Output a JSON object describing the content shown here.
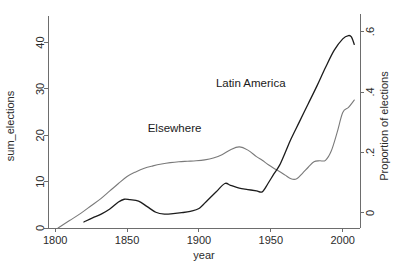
{
  "chart_data": {
    "type": "line",
    "title": "",
    "xlabel": "year",
    "ylabel": "sum_elections",
    "ylabel_right": "Proportion of elections",
    "xlim": [
      1795,
      2012
    ],
    "ylim": [
      0,
      44
    ],
    "ylim_right": [
      -0.05,
      0.625
    ],
    "grid": false,
    "legend": "inline-annotations",
    "xticks": [
      1800,
      1850,
      1900,
      1950,
      2000
    ],
    "xtick_labels": [
      "1800",
      "1850",
      "1900",
      "1950",
      "2000"
    ],
    "yticks": [
      0,
      10,
      20,
      30,
      40
    ],
    "ytick_labels": [
      "0",
      "10",
      "20",
      "30",
      "40"
    ],
    "yticks_right": [
      0,
      0.2,
      0.4,
      0.6
    ],
    "ytick_labels_right": [
      "0",
      ".2",
      ".4",
      ".6"
    ],
    "annotations": [
      {
        "text": "Latin America",
        "x": 1936,
        "y": 30.5
      },
      {
        "text": "Elsewhere",
        "x": 1883,
        "y": 20.8
      }
    ],
    "series": [
      {
        "name": "Elsewhere",
        "color": "#7a7a7a",
        "width": 1.1,
        "axis": "right",
        "x": [
          1802,
          1810,
          1818,
          1825,
          1832,
          1838,
          1844,
          1850,
          1856,
          1862,
          1868,
          1874,
          1880,
          1886,
          1892,
          1898,
          1904,
          1910,
          1916,
          1922,
          1928,
          1934,
          1940,
          1944,
          1948,
          1952,
          1956,
          1960,
          1964,
          1968,
          1972,
          1976,
          1980,
          1984,
          1988,
          1992,
          1996,
          2000,
          2004,
          2008
        ],
        "values": [
          0.0,
          1.6,
          3.2,
          4.8,
          6.4,
          8.0,
          9.6,
          11.1,
          12.1,
          12.9,
          13.4,
          13.8,
          14.1,
          14.3,
          14.4,
          14.5,
          14.7,
          15.1,
          15.8,
          16.9,
          17.5,
          16.8,
          15.4,
          14.6,
          13.7,
          12.9,
          12.2,
          11.4,
          10.6,
          10.6,
          11.8,
          13.1,
          14.3,
          14.5,
          14.6,
          16.6,
          20.5,
          24.9,
          26.0,
          27.6
        ]
      },
      {
        "name": "Latin America",
        "color": "#1c1c1c",
        "width": 1.3,
        "axis": "left",
        "x": [
          1820,
          1826,
          1832,
          1838,
          1844,
          1848,
          1852,
          1858,
          1864,
          1870,
          1876,
          1882,
          1888,
          1894,
          1900,
          1906,
          1912,
          1918,
          1922,
          1928,
          1934,
          1940,
          1944,
          1948,
          1952,
          1956,
          1960,
          1964,
          1970,
          1976,
          1982,
          1988,
          1994,
          2000,
          2004,
          2006,
          2008
        ],
        "values": [
          1.3,
          2.2,
          3.0,
          4.1,
          5.6,
          6.2,
          6.1,
          5.8,
          4.6,
          3.4,
          3.0,
          3.1,
          3.3,
          3.6,
          4.2,
          6.0,
          7.8,
          9.6,
          9.2,
          8.6,
          8.3,
          8.0,
          7.8,
          9.6,
          11.6,
          13.5,
          16.3,
          19.2,
          23.0,
          26.8,
          30.6,
          34.6,
          38.3,
          40.8,
          41.5,
          41.2,
          39.6
        ]
      }
    ]
  },
  "colors": {
    "axis": "#6d6d6d",
    "text": "#2b2b2b",
    "background": "#ffffff",
    "series_latin_america": "#1c1c1c",
    "series_elsewhere": "#7a7a7a"
  }
}
